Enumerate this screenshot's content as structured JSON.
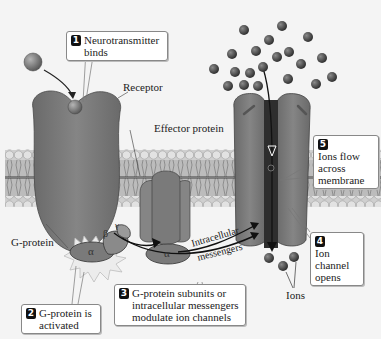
{
  "diagram": {
    "type": "neurotransmitter-gprotein-ion-channel-pathway",
    "colors": {
      "background": "#f4f4f4",
      "protein": "#7a7a7a",
      "protein_dark": "#5a5a5a",
      "membrane_head": "#d9d9d9",
      "ion": "#3c3c3c",
      "gprotein_star": "#e8e8e8"
    },
    "labels": {
      "receptor": "Receptor",
      "effector_protein": "Effector protein",
      "g_protein": "G-protein",
      "alpha": "α",
      "beta": "β",
      "gamma": "γ",
      "alpha_effector": "α",
      "intracellular": "Intracellular",
      "messengers": "messengers",
      "ions": "Ions"
    },
    "steps": [
      {
        "num": "1",
        "lines": [
          "Neurotransmitter",
          "binds"
        ]
      },
      {
        "num": "2",
        "lines": [
          "G-protein is",
          "activated"
        ]
      },
      {
        "num": "3",
        "lines": [
          "G-protein subunits or",
          "intracellular messengers",
          "modulate ion channels"
        ]
      },
      {
        "num": "4",
        "lines": [
          "Ion",
          "channel",
          "opens"
        ]
      },
      {
        "num": "5",
        "lines": [
          "Ions flow",
          "across",
          "membrane"
        ]
      }
    ]
  }
}
